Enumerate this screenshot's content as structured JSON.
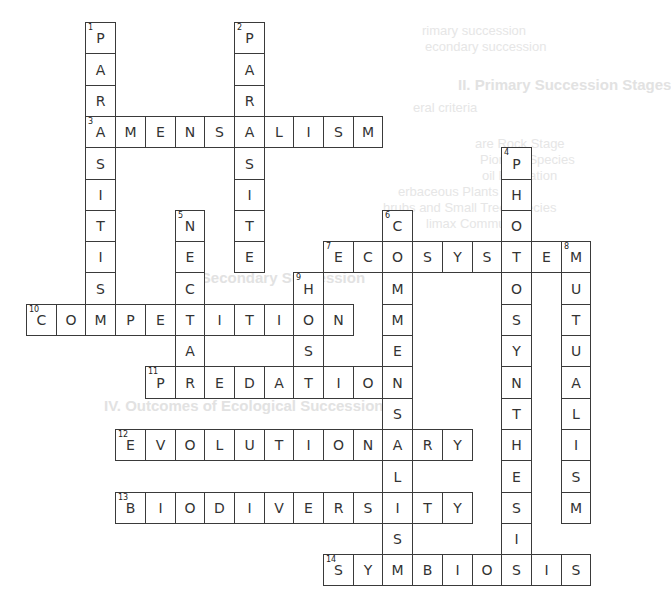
{
  "puzzle": {
    "grid_origin": {
      "x": 26,
      "y": 22
    },
    "cell_size": {
      "w": 29.7,
      "h": 31.3
    },
    "words": [
      {
        "number": 1,
        "answer": "PARASITIS",
        "direction": "down",
        "row": 0,
        "col": 2
      },
      {
        "number": 2,
        "answer": "PARASITE",
        "direction": "down",
        "row": 0,
        "col": 7
      },
      {
        "number": 3,
        "answer": "AMENSALISM",
        "direction": "across",
        "row": 3,
        "col": 2
      },
      {
        "number": 4,
        "answer": "PHOTOSYNTHESIS",
        "direction": "down",
        "row": 4,
        "col": 16
      },
      {
        "number": 5,
        "answer": "NECTAR",
        "direction": "down",
        "row": 6,
        "col": 5
      },
      {
        "number": 6,
        "answer": "COMMENSALISM",
        "direction": "down",
        "row": 6,
        "col": 12
      },
      {
        "number": 7,
        "answer": "ECOSYSTEM",
        "direction": "across",
        "row": 7,
        "col": 10
      },
      {
        "number": 8,
        "answer": "MUTUALISM",
        "direction": "down",
        "row": 7,
        "col": 18
      },
      {
        "number": 9,
        "answer": "HOST",
        "direction": "down",
        "row": 8,
        "col": 9
      },
      {
        "number": 10,
        "answer": "COMPETITION",
        "direction": "across",
        "row": 9,
        "col": 0
      },
      {
        "number": 11,
        "answer": "PREDATION",
        "direction": "across",
        "row": 11,
        "col": 4
      },
      {
        "number": 12,
        "answer": "EVOLUTIONARY",
        "direction": "across",
        "row": 13,
        "col": 3
      },
      {
        "number": 13,
        "answer": "BIODIVERSITY",
        "direction": "across",
        "row": 15,
        "col": 3
      },
      {
        "number": 14,
        "answer": "SYMBIOSIS",
        "direction": "across",
        "row": 17,
        "col": 10
      }
    ]
  },
  "bleed_through": {
    "line1": "rimary succession",
    "line2": "econdary succession",
    "heading": "II. Primary Succession Stages",
    "line3": "eral criteria",
    "line4": "are Rock Stage",
    "line5": "Pioneer Species",
    "line6": "oil Formation",
    "line7": "erbaceous Plants",
    "line8": "hrubs and Small Tree Species",
    "line9": "limax Community",
    "heading2": "III. Secondary Succession",
    "heading3": "IV. Outcomes of Ecological Succession"
  }
}
